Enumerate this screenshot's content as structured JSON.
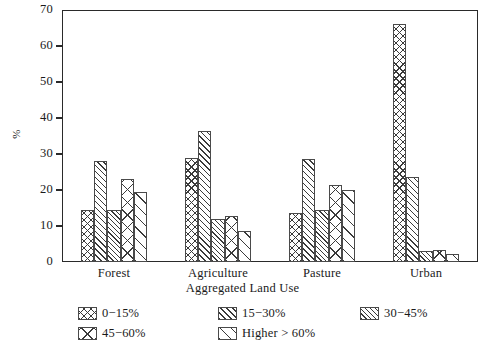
{
  "chart_data": {
    "type": "bar",
    "title": "",
    "xlabel": "Aggregated Land Use",
    "ylabel": "%",
    "ylim": [
      0,
      70
    ],
    "yticks": [
      0,
      10,
      20,
      30,
      40,
      50,
      60,
      70
    ],
    "grid": false,
    "legend_position": "bottom",
    "categories": [
      "Forest",
      "Agriculture",
      "Pasture",
      "Urban"
    ],
    "series": [
      {
        "name": "0−15%",
        "pattern": "crosshatch-dense",
        "values": [
          14.5,
          29.0,
          13.5,
          66.0
        ]
      },
      {
        "name": "15−30%",
        "pattern": "diagonal-dense",
        "values": [
          28.0,
          36.5,
          28.5,
          23.5
        ]
      },
      {
        "name": "30−45%",
        "pattern": "diagonal-medium",
        "values": [
          14.5,
          12.0,
          14.5,
          3.0
        ]
      },
      {
        "name": "45−60%",
        "pattern": "cross-sparse",
        "values": [
          23.0,
          12.8,
          21.5,
          3.3
        ]
      },
      {
        "name": "Higher > 60%",
        "pattern": "diagonal-sparse",
        "values": [
          19.5,
          8.5,
          20.0,
          2.3
        ]
      }
    ]
  },
  "axis": {
    "y_label": "%",
    "x_label": "Aggregated Land Use",
    "y_tick_labels": [
      "0",
      "10",
      "20",
      "30",
      "40",
      "50",
      "60",
      "70"
    ],
    "x_tick_labels": [
      "Forest",
      "Agriculture",
      "Pasture",
      "Urban"
    ]
  },
  "legend": {
    "items": [
      {
        "label": "0−15%"
      },
      {
        "label": "15−30%"
      },
      {
        "label": "30−45%"
      },
      {
        "label": "45−60%"
      },
      {
        "label": "Higher > 60%"
      }
    ]
  }
}
